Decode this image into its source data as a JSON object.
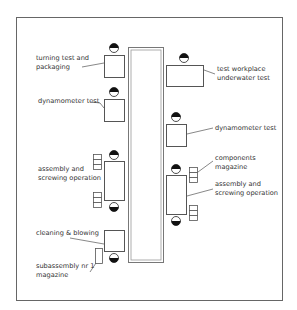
{
  "diagram": {
    "type": "assembly-line-layout",
    "conveyor": "central-conveyor",
    "stations": [
      {
        "id": "turning",
        "label_lines": [
          "turning test and",
          "packaging"
        ],
        "side": "left"
      },
      {
        "id": "dyno-left",
        "label_lines": [
          "dynamometer test"
        ],
        "side": "left"
      },
      {
        "id": "assembly-left",
        "label_lines": [
          "assembly and",
          "screwing operation"
        ],
        "side": "left"
      },
      {
        "id": "cleaning",
        "label_lines": [
          "cleaning & blowing"
        ],
        "side": "left"
      },
      {
        "id": "subassembly",
        "label_lines": [
          "subassembly nr 1",
          "magazine"
        ],
        "side": "left"
      },
      {
        "id": "underwater",
        "label_lines": [
          "test workplace",
          "underwater test"
        ],
        "side": "right"
      },
      {
        "id": "dyno-right",
        "label_lines": [
          "dynamometer test"
        ],
        "side": "right"
      },
      {
        "id": "components",
        "label_lines": [
          "components",
          "magazine"
        ],
        "side": "right"
      },
      {
        "id": "assembly-right",
        "label_lines": [
          "assembly and",
          "screwing operation"
        ],
        "side": "right"
      }
    ],
    "colors": {
      "line": "#555555",
      "frame": "#666666",
      "text": "#333333",
      "worker": "#111111"
    }
  }
}
